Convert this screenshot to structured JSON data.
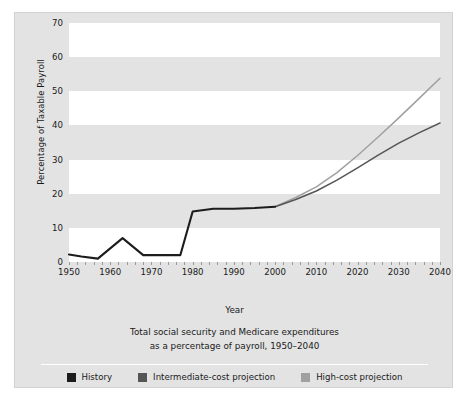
{
  "chart_data": {
    "type": "line",
    "title": "Total social security and Medicare expenditures as a percentage of payroll, 1950–2040",
    "caption_line1": "Total social security and Medicare expenditures",
    "caption_line2": "as a percentage of payroll, 1950–2040",
    "xlabel": "Year",
    "ylabel": "Percentage of Taxable Payroll",
    "xlim": [
      1950,
      2040
    ],
    "ylim": [
      0,
      70
    ],
    "xticks": [
      1950,
      1960,
      1970,
      1980,
      1990,
      2000,
      2010,
      2020,
      2030,
      2040
    ],
    "yticks": [
      0,
      10,
      20,
      30,
      40,
      50,
      60,
      70
    ],
    "grid": "alternating-horizontal-bands",
    "legend_position": "bottom",
    "series": [
      {
        "name": "History",
        "color": "#1c1c1c",
        "x": [
          1950,
          1953,
          1957,
          1963,
          1968,
          1977,
          1980,
          1985,
          1990,
          1995,
          2000
        ],
        "values": [
          2.2,
          1.6,
          1.0,
          7.0,
          2.0,
          2.0,
          14.8,
          15.6,
          15.6,
          15.8,
          16.2
        ]
      },
      {
        "name": "Intermediate-cost projection",
        "color": "#555555",
        "x": [
          2000,
          2005,
          2010,
          2015,
          2020,
          2025,
          2030,
          2035,
          2040
        ],
        "values": [
          16.2,
          18.3,
          20.8,
          24.0,
          27.6,
          31.3,
          34.8,
          37.9,
          40.7
        ]
      },
      {
        "name": "High-cost projection",
        "color": "#a0a0a0",
        "x": [
          2000,
          2005,
          2010,
          2015,
          2020,
          2025,
          2030,
          2035,
          2040
        ],
        "values": [
          16.2,
          18.9,
          22.0,
          26.2,
          31.2,
          36.6,
          42.2,
          48.0,
          53.8
        ]
      }
    ]
  },
  "legend": {
    "items": [
      {
        "label": "History",
        "color": "#1c1c1c"
      },
      {
        "label": "Intermediate-cost projection",
        "color": "#555555"
      },
      {
        "label": "High-cost projection",
        "color": "#a0a0a0"
      }
    ]
  },
  "colors": {
    "panel_background": "#e3e3e3",
    "panel_border": "#d2d2d2",
    "band_light": "#ffffff",
    "band_dark": "#e3e3e3",
    "text": "#1a1a1a",
    "tick": "#9a9a9a"
  }
}
